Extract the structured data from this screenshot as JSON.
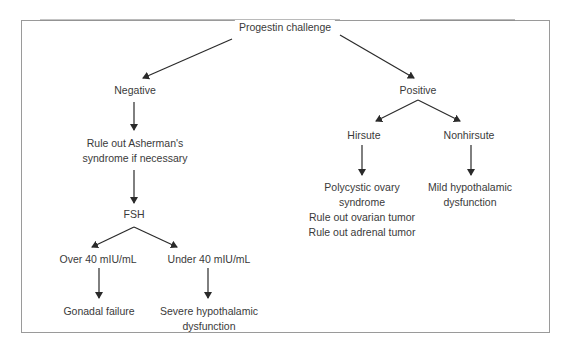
{
  "diagram": {
    "root": "Progestin challenge",
    "negative": {
      "label": "Negative",
      "step1": [
        "Rule out Asherman's",
        "syndrome if necessary"
      ],
      "fsh": "FSH",
      "over": {
        "label": "Over 40 mIU/mL",
        "result": "Gonadal failure"
      },
      "under": {
        "label": "Under 40 mIU/mL",
        "result": [
          "Severe hypothalamic",
          "dysfunction"
        ]
      }
    },
    "positive": {
      "label": "Positive",
      "hirsute": {
        "label": "Hirsute",
        "result": [
          "Polycystic ovary",
          "syndrome",
          "Rule out ovarian tumor",
          "Rule out adrenal tumor"
        ]
      },
      "nonhirsute": {
        "label": "Nonhirsute",
        "result": [
          "Mild hypothalamic",
          "dysfunction"
        ]
      }
    }
  },
  "colors": {
    "line": "#2a2a2a",
    "text": "#3a3a3a",
    "frame": "#9a9a9a"
  }
}
